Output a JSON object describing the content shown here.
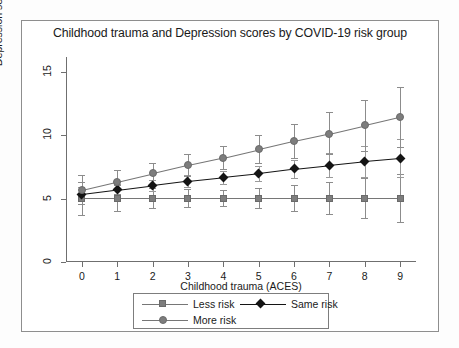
{
  "figure": {
    "title": "Childhood trauma and Depression scores by COVID-19 risk group"
  },
  "axes": {
    "x_label": "Childhood trauma (ACES)",
    "y_label": "Depression severity (CES-D-10)",
    "x_ticks": [
      "0",
      "1",
      "2",
      "3",
      "4",
      "5",
      "6",
      "7",
      "8",
      "9"
    ],
    "y_ticks": [
      "0",
      "5",
      "10",
      "15"
    ]
  },
  "legend": {
    "items": [
      {
        "label": "Less risk",
        "marker": "square-marker-icon",
        "color": "#7d7d7d"
      },
      {
        "label": "Same risk",
        "marker": "diamond-marker-icon",
        "color": "#141414"
      },
      {
        "label": "More risk",
        "marker": "circle-marker-icon",
        "color": "#7d7d7d"
      }
    ]
  },
  "chart_data": {
    "type": "line",
    "title": "Childhood trauma and Depression scores by COVID-19 risk group",
    "xlabel": "Childhood trauma (ACES)",
    "ylabel": "Depression severity (CES-D-10)",
    "x": [
      0,
      1,
      2,
      3,
      4,
      5,
      6,
      7,
      8,
      9
    ],
    "xlim": [
      -0.45,
      9.45
    ],
    "ylim": [
      0,
      16.2
    ],
    "grid": false,
    "legend_position": "below-axes",
    "errorbars": "95% CI",
    "series": [
      {
        "name": "Less risk",
        "marker": "square",
        "color": "#7d7d7d",
        "values": [
          5.05,
          5.05,
          5.05,
          5.05,
          5.05,
          5.05,
          5.05,
          5.05,
          5.05,
          5.05
        ],
        "ci_low": [
          3.75,
          4.05,
          4.25,
          4.35,
          4.4,
          4.25,
          4.05,
          3.8,
          3.5,
          3.15
        ],
        "ci_high": [
          6.35,
          6.05,
          5.85,
          5.75,
          5.7,
          5.85,
          6.05,
          6.3,
          6.6,
          6.95
        ]
      },
      {
        "name": "Same risk",
        "marker": "diamond",
        "color": "#141414",
        "values": [
          5.35,
          5.7,
          6.05,
          6.4,
          6.7,
          7.0,
          7.35,
          7.65,
          7.95,
          8.2
        ],
        "ci_low": [
          4.8,
          5.25,
          5.6,
          5.95,
          6.2,
          6.4,
          6.6,
          6.7,
          6.75,
          6.75
        ],
        "ci_high": [
          5.95,
          6.2,
          6.5,
          6.85,
          7.2,
          7.6,
          8.1,
          8.6,
          9.15,
          9.7
        ]
      },
      {
        "name": "More risk",
        "marker": "circle",
        "color": "#7d7d7d",
        "values": [
          5.7,
          6.35,
          7.0,
          7.65,
          8.25,
          8.9,
          9.55,
          10.15,
          10.8,
          11.45
        ],
        "ci_low": [
          4.55,
          5.4,
          6.15,
          6.8,
          7.35,
          7.8,
          8.2,
          8.5,
          8.8,
          9.05
        ],
        "ci_high": [
          6.85,
          7.3,
          7.85,
          8.5,
          9.15,
          10.0,
          10.9,
          11.85,
          12.8,
          13.85
        ]
      }
    ]
  }
}
